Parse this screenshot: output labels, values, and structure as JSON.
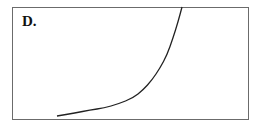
{
  "panel": {
    "label": "D."
  },
  "chart_data": {
    "type": "line",
    "title": "D.",
    "xlabel": "",
    "ylabel": "",
    "grid": false,
    "legend": null,
    "series": [
      {
        "name": "curve",
        "points_px": [
          [
            57,
            116
          ],
          [
            75,
            113
          ],
          [
            90,
            110
          ],
          [
            104,
            108
          ],
          [
            118,
            104
          ],
          [
            133,
            98
          ],
          [
            143,
            90
          ],
          [
            152,
            80
          ],
          [
            160,
            68
          ],
          [
            167,
            55
          ],
          [
            173,
            38
          ],
          [
            178,
            22
          ],
          [
            182,
            7
          ]
        ]
      }
    ],
    "color": "#222222"
  }
}
